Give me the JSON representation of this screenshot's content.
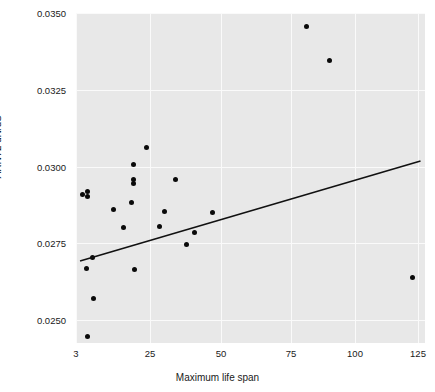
{
  "chart_data": {
    "type": "scatter",
    "title": "",
    "xlabel": "Maximum life span",
    "ylabel": "ARNTL dN/dS",
    "xticks": [
      3,
      25,
      50,
      75,
      100,
      125
    ],
    "xtick_labels": [
      "3",
      "25",
      "50",
      "75",
      "100",
      "125"
    ],
    "yticks": [
      0.025,
      0.0275,
      0.03,
      0.0325,
      0.035
    ],
    "ytick_labels": [
      "0.0250",
      "0.0275",
      "0.0300",
      "0.0325",
      "0.0350"
    ],
    "xlim": [
      3,
      130
    ],
    "ylim": [
      0.02405,
      0.03518
    ],
    "grid": true,
    "legend": null,
    "xscale": "sqrt-like",
    "panel_background": "#e8e8e8",
    "grid_color": "#fafafa",
    "point_color": "#0a0a0a",
    "line_color": "#111111",
    "points": [
      {
        "x": 5.0,
        "y": 0.02908
      },
      {
        "x": 6.4,
        "y": 0.0292
      },
      {
        "x": 6.4,
        "y": 0.02902
      },
      {
        "x": 6.0,
        "y": 0.02668
      },
      {
        "x": 6.3,
        "y": 0.02446
      },
      {
        "x": 8.0,
        "y": 0.02702
      },
      {
        "x": 8.3,
        "y": 0.02569
      },
      {
        "x": 14.0,
        "y": 0.02861
      },
      {
        "x": 17.0,
        "y": 0.028
      },
      {
        "x": 19.5,
        "y": 0.02884
      },
      {
        "x": 20.0,
        "y": 0.03006
      },
      {
        "x": 20.2,
        "y": 0.02957
      },
      {
        "x": 20.2,
        "y": 0.02944
      },
      {
        "x": 20.5,
        "y": 0.02665
      },
      {
        "x": 24.0,
        "y": 0.03061
      },
      {
        "x": 28.5,
        "y": 0.02806
      },
      {
        "x": 30.0,
        "y": 0.02855
      },
      {
        "x": 34.0,
        "y": 0.02957
      },
      {
        "x": 38.0,
        "y": 0.02745
      },
      {
        "x": 40.5,
        "y": 0.02786
      },
      {
        "x": 47.0,
        "y": 0.0285
      },
      {
        "x": 81.0,
        "y": 0.03456
      },
      {
        "x": 90.0,
        "y": 0.03345
      },
      {
        "x": 123.0,
        "y": 0.02637
      }
    ],
    "trendline": {
      "x_start": 4.2,
      "y_start": 0.02692,
      "x_end": 126.0,
      "y_end": 0.03018
    }
  }
}
